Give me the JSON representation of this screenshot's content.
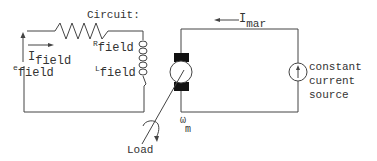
{
  "diagram": {
    "title": "Circuit:",
    "field_circuit": {
      "voltage_label": "e",
      "voltage_sub": "field",
      "current_label": "I",
      "current_sub": "field",
      "resistor_label": "R",
      "resistor_sub": "field",
      "inductor_label": "L",
      "inductor_sub": "field"
    },
    "armature_circuit": {
      "current_label": "I",
      "current_sub": "mar",
      "speed_label": "ω",
      "speed_sub": "m",
      "source_line1": "constant",
      "source_line2": "current",
      "source_line3": "source"
    },
    "load_label": "Load",
    "colors": {
      "line": "#444444",
      "brush": "#111111",
      "text": "#333333",
      "background": "#ffffff"
    }
  }
}
